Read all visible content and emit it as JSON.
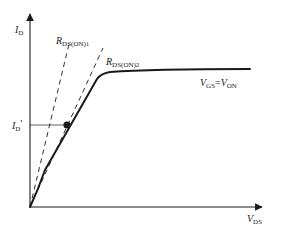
{
  "diagram": {
    "axes": {
      "y_label_main": "I",
      "y_label_sub": "D",
      "x_label_main": "V",
      "x_label_sub": "DS"
    },
    "curves": [
      {
        "name": "output-characteristic",
        "label_main_1": "V",
        "label_sub_1": "GS",
        "label_eq": "=",
        "label_main_2": "V",
        "label_sub_2": "ON",
        "style": "solid-thick"
      }
    ],
    "dashed_lines": [
      {
        "name": "rds-on-1",
        "label_main": "R",
        "label_sub": "DS(ON)1",
        "style": "dashed"
      },
      {
        "name": "rds-on-2",
        "label_main": "R",
        "label_sub": "DS(ON)2",
        "style": "dashed"
      }
    ],
    "marker": {
      "name": "operating-point",
      "y_tick_label_main": "I",
      "y_tick_label_sub": "D",
      "y_tick_prime": "'"
    },
    "colors": {
      "line": "#1a1a1a",
      "background": "#ffffff"
    }
  }
}
